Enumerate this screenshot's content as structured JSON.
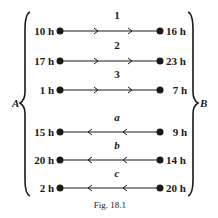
{
  "diagram": {
    "left_group_label": "A",
    "right_group_label": "B",
    "caption": "Fig. 18.1",
    "edges": [
      {
        "label": "1",
        "left_time": "10 h",
        "right_time": "16 h",
        "direction": "A-to-B"
      },
      {
        "label": "2",
        "left_time": "17 h",
        "right_time": "23 h",
        "direction": "A-to-B"
      },
      {
        "label": "3",
        "left_time": "1 h",
        "right_time": "7 h",
        "direction": "A-to-B"
      },
      {
        "label": "a",
        "left_time": "15 h",
        "right_time": "9 h",
        "direction": "B-to-A"
      },
      {
        "label": "b",
        "left_time": "20 h",
        "right_time": "14 h",
        "direction": "B-to-A"
      },
      {
        "label": "c",
        "left_time": "2 h",
        "right_time": "20 h",
        "direction": "B-to-A"
      }
    ]
  }
}
